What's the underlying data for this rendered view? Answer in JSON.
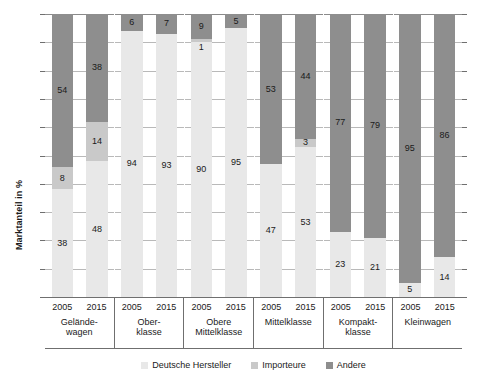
{
  "chart_data": {
    "type": "bar",
    "subtype": "stacked-column-100",
    "title": "",
    "xlabel": "",
    "ylabel": "Marktanteil in %",
    "ylim": [
      0,
      100
    ],
    "ytick_step": 10,
    "grid": true,
    "legend_position": "bottom",
    "categories": [
      "Geländewagen 2005",
      "Geländewagen 2015",
      "Oberklasse 2005",
      "Oberklasse 2015",
      "Obere Mittelklasse 2005",
      "Obere Mittelklasse 2015",
      "Mittelklasse 2005",
      "Mittelklasse 2015",
      "Kompaktklasse 2005",
      "Kompaktklasse 2015",
      "Kleinwagen 2005",
      "Kleinwagen 2015"
    ],
    "series": [
      {
        "name": "Deutsche Hersteller",
        "color": "#e8e8e8",
        "values": [
          38,
          48,
          94,
          93,
          90,
          95,
          47,
          53,
          23,
          21,
          5,
          14
        ]
      },
      {
        "name": "Importeure",
        "color": "#c9c9c9",
        "values": [
          8,
          14,
          0,
          0,
          1,
          0,
          0,
          3,
          0,
          0,
          0,
          0
        ]
      },
      {
        "name": "Andere",
        "color": "#8e8e8e",
        "values": [
          54,
          38,
          6,
          7,
          9,
          5,
          53,
          44,
          77,
          79,
          95,
          86
        ]
      }
    ]
  },
  "yaxis": {
    "title": "Marktanteil in %",
    "min": 0,
    "max": 100,
    "step": 10
  },
  "xaxis": {
    "groups": [
      {
        "name": "Geländewagen",
        "name_display": "Gelände-\nwagen",
        "years": [
          "2005",
          "2015"
        ]
      },
      {
        "name": "Oberklasse",
        "name_display": "Ober-\nklasse",
        "years": [
          "2005",
          "2015"
        ]
      },
      {
        "name": "Obere Mittelklasse",
        "name_display": "Obere\nMittelklasse",
        "years": [
          "2005",
          "2015"
        ]
      },
      {
        "name": "Mittelklasse",
        "name_display": "Mittelklasse",
        "years": [
          "2005",
          "2015"
        ]
      },
      {
        "name": "Kompaktklasse",
        "name_display": "Kompakt-\nklasse",
        "years": [
          "2005",
          "2015"
        ]
      },
      {
        "name": "Kleinwagen",
        "name_display": "Kleinwagen",
        "years": [
          "2005",
          "2015"
        ]
      }
    ]
  },
  "bars": [
    {
      "group": "Geländewagen",
      "year": "2005",
      "segments": [
        {
          "series": "Deutsche Hersteller",
          "value": 38,
          "label": "38",
          "show_label": true
        },
        {
          "series": "Importeure",
          "value": 8,
          "label": "8",
          "show_label": true
        },
        {
          "series": "Andere",
          "value": 54,
          "label": "54",
          "show_label": true
        }
      ]
    },
    {
      "group": "Geländewagen",
      "year": "2015",
      "segments": [
        {
          "series": "Deutsche Hersteller",
          "value": 48,
          "label": "48",
          "show_label": true
        },
        {
          "series": "Importeure",
          "value": 14,
          "label": "14",
          "show_label": true
        },
        {
          "series": "Andere",
          "value": 38,
          "label": "38",
          "show_label": true
        }
      ]
    },
    {
      "group": "Oberklasse",
      "year": "2005",
      "segments": [
        {
          "series": "Deutsche Hersteller",
          "value": 94,
          "label": "94",
          "show_label": true
        },
        {
          "series": "Importeure",
          "value": 0,
          "label": "",
          "show_label": false
        },
        {
          "series": "Andere",
          "value": 6,
          "label": "6",
          "show_label": true
        }
      ]
    },
    {
      "group": "Oberklasse",
      "year": "2015",
      "segments": [
        {
          "series": "Deutsche Hersteller",
          "value": 93,
          "label": "93",
          "show_label": true
        },
        {
          "series": "Importeure",
          "value": 0,
          "label": "",
          "show_label": false
        },
        {
          "series": "Andere",
          "value": 7,
          "label": "7",
          "show_label": true
        }
      ]
    },
    {
      "group": "Obere Mittelklasse",
      "year": "2005",
      "segments": [
        {
          "series": "Deutsche Hersteller",
          "value": 90,
          "label": "90",
          "show_label": true
        },
        {
          "series": "Importeure",
          "value": 1,
          "label": "1",
          "show_label": true,
          "label_outside": true
        },
        {
          "series": "Andere",
          "value": 9,
          "label": "9",
          "show_label": true
        }
      ]
    },
    {
      "group": "Obere Mittelklasse",
      "year": "2015",
      "segments": [
        {
          "series": "Deutsche Hersteller",
          "value": 95,
          "label": "95",
          "show_label": true
        },
        {
          "series": "Importeure",
          "value": 0,
          "label": "",
          "show_label": false
        },
        {
          "series": "Andere",
          "value": 5,
          "label": "5",
          "show_label": true
        }
      ]
    },
    {
      "group": "Mittelklasse",
      "year": "2005",
      "segments": [
        {
          "series": "Deutsche Hersteller",
          "value": 47,
          "label": "47",
          "show_label": true
        },
        {
          "series": "Importeure",
          "value": 0,
          "label": "",
          "show_label": false
        },
        {
          "series": "Andere",
          "value": 53,
          "label": "53",
          "show_label": true
        }
      ]
    },
    {
      "group": "Mittelklasse",
      "year": "2015",
      "segments": [
        {
          "series": "Deutsche Hersteller",
          "value": 53,
          "label": "53",
          "show_label": true
        },
        {
          "series": "Importeure",
          "value": 3,
          "label": "3",
          "show_label": true
        },
        {
          "series": "Andere",
          "value": 44,
          "label": "44",
          "show_label": true
        }
      ]
    },
    {
      "group": "Kompaktklasse",
      "year": "2005",
      "segments": [
        {
          "series": "Deutsche Hersteller",
          "value": 23,
          "label": "23",
          "show_label": true
        },
        {
          "series": "Importeure",
          "value": 0,
          "label": "",
          "show_label": false
        },
        {
          "series": "Andere",
          "value": 77,
          "label": "77",
          "show_label": true
        }
      ]
    },
    {
      "group": "Kompaktklasse",
      "year": "2015",
      "segments": [
        {
          "series": "Deutsche Hersteller",
          "value": 21,
          "label": "21",
          "show_label": true
        },
        {
          "series": "Importeure",
          "value": 0,
          "label": "",
          "show_label": false
        },
        {
          "series": "Andere",
          "value": 79,
          "label": "79",
          "show_label": true
        }
      ]
    },
    {
      "group": "Kleinwagen",
      "year": "2005",
      "segments": [
        {
          "series": "Deutsche Hersteller",
          "value": 5,
          "label": "5",
          "show_label": true
        },
        {
          "series": "Importeure",
          "value": 0,
          "label": "",
          "show_label": false
        },
        {
          "series": "Andere",
          "value": 95,
          "label": "95",
          "show_label": true
        }
      ]
    },
    {
      "group": "Kleinwagen",
      "year": "2015",
      "segments": [
        {
          "series": "Deutsche Hersteller",
          "value": 14,
          "label": "14",
          "show_label": true
        },
        {
          "series": "Importeure",
          "value": 0,
          "label": "",
          "show_label": false
        },
        {
          "series": "Andere",
          "value": 86,
          "label": "86",
          "show_label": true
        }
      ]
    }
  ],
  "legend": {
    "items": [
      {
        "label": "Deutsche Hersteller",
        "color": "#e8e8e8"
      },
      {
        "label": "Importeure",
        "color": "#c9c9c9"
      },
      {
        "label": "Andere",
        "color": "#8e8e8e"
      }
    ]
  },
  "colors": {
    "deutsche_hersteller": "#e8e8e8",
    "importeure": "#c9c9c9",
    "andere": "#8e8e8e",
    "gridline": "#b9b9b9",
    "axis": "#6f6f6f",
    "text": "#1a1a1a"
  }
}
